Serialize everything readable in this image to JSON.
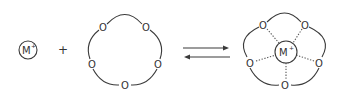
{
  "diagram": {
    "reactants": {
      "cation": {
        "symbol": "M",
        "charge": "+"
      },
      "operator": "+",
      "crown_ether": {
        "oxygen_label": "O",
        "oxygen_count": 5
      }
    },
    "equilibrium": {
      "forward_label": "",
      "reverse_label": ""
    },
    "product": {
      "cation": {
        "symbol": "M",
        "charge": "+"
      },
      "oxygen_label": "O",
      "oxygen_count": 5,
      "coordination": "dotted"
    },
    "colors": {
      "line": "#3a3a3a",
      "text": "#333333",
      "background": "#ffffff"
    }
  }
}
